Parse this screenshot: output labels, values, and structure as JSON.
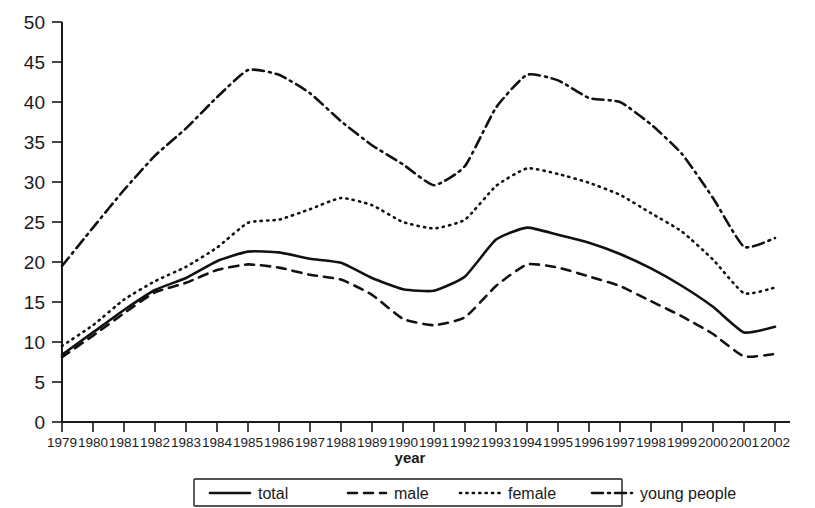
{
  "chart_data": {
    "type": "line",
    "title": "",
    "xlabel": "year",
    "ylabel": "",
    "xlim": [
      1979,
      2002
    ],
    "ylim": [
      0,
      50
    ],
    "grid": false,
    "legend_position": "bottom",
    "x": [
      1979,
      1980,
      1981,
      1982,
      1983,
      1984,
      1985,
      1986,
      1987,
      1988,
      1989,
      1990,
      1991,
      1992,
      1993,
      1994,
      1995,
      1996,
      1997,
      1998,
      1999,
      2000,
      2001,
      2002
    ],
    "categories": [
      "1979",
      "1980",
      "1981",
      "1982",
      "1983",
      "1984",
      "1985",
      "1986",
      "1987",
      "1988",
      "1989",
      "1990",
      "1991",
      "1992",
      "1993",
      "1994",
      "1995",
      "1996",
      "1997",
      "1998",
      "1999",
      "2000",
      "2001",
      "2002"
    ],
    "y_ticks": [
      0,
      5,
      10,
      15,
      20,
      25,
      30,
      35,
      40,
      45,
      50
    ],
    "series": [
      {
        "name": "total",
        "style": "solid",
        "values": [
          8.4,
          11.2,
          14.0,
          16.5,
          18.0,
          20.1,
          21.3,
          21.2,
          20.4,
          19.9,
          18.0,
          16.6,
          16.4,
          18.2,
          22.8,
          24.3,
          23.4,
          22.4,
          21.0,
          19.2,
          17.0,
          14.4,
          11.2,
          11.9
        ]
      },
      {
        "name": "male",
        "style": "dashed",
        "values": [
          8.1,
          10.8,
          13.6,
          16.2,
          17.4,
          19.0,
          19.7,
          19.3,
          18.4,
          17.8,
          15.9,
          12.9,
          12.1,
          13.1,
          17.0,
          19.7,
          19.3,
          18.2,
          17.0,
          15.1,
          13.2,
          11.0,
          8.2,
          8.5
        ]
      },
      {
        "name": "female",
        "style": "dotted",
        "values": [
          9.5,
          12.1,
          15.3,
          17.6,
          19.4,
          21.8,
          24.9,
          25.3,
          26.6,
          28.0,
          27.1,
          25.0,
          24.2,
          25.3,
          29.5,
          31.7,
          31.0,
          29.9,
          28.4,
          26.1,
          23.8,
          20.3,
          16.1,
          16.8
        ]
      },
      {
        "name": "young people",
        "style": "dash-dot",
        "values": [
          19.5,
          24.3,
          29.0,
          33.3,
          36.7,
          40.6,
          44.0,
          43.4,
          41.1,
          37.6,
          34.6,
          32.2,
          29.6,
          32.0,
          39.3,
          43.4,
          42.7,
          40.5,
          40.0,
          37.2,
          33.5,
          28.0,
          21.9,
          23.0
        ]
      }
    ]
  },
  "legend": {
    "items": [
      {
        "label": "total",
        "style": "solid"
      },
      {
        "label": "male",
        "style": "dashed"
      },
      {
        "label": "female",
        "style": "dotted"
      },
      {
        "label": "young people",
        "style": "dash-dot"
      }
    ]
  },
  "axes": {
    "x_title": "year"
  }
}
